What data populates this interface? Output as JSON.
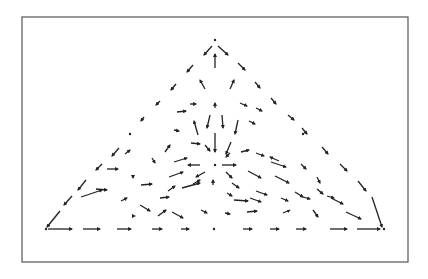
{
  "figure": {
    "frame": {
      "x": 22,
      "y": 17,
      "w": 386,
      "h": 245,
      "stroke": "#555555"
    },
    "vertices": [
      [
        215,
        41
      ],
      [
        44,
        229
      ],
      [
        384,
        229
      ],
      [
        215,
        165
      ]
    ],
    "segments": [
      [
        212,
        46,
        204,
        55
      ],
      [
        193,
        65,
        187,
        72
      ],
      [
        176,
        84,
        171,
        90
      ],
      [
        160,
        101,
        156,
        105
      ],
      [
        144,
        117,
        141,
        121
      ],
      [
        119,
        148,
        112,
        156
      ],
      [
        102,
        164,
        96,
        170
      ],
      [
        86,
        180,
        78,
        190
      ],
      [
        72,
        196,
        64,
        205
      ],
      [
        60,
        211,
        47,
        227
      ],
      [
        218,
        46,
        228,
        55
      ],
      [
        238,
        63,
        245,
        70
      ],
      [
        255,
        82,
        260,
        88
      ],
      [
        271,
        98,
        276,
        104
      ],
      [
        288,
        115,
        294,
        120
      ],
      [
        302,
        128,
        307,
        134
      ],
      [
        322,
        147,
        328,
        154
      ],
      [
        340,
        164,
        347,
        171
      ],
      [
        358,
        181,
        366,
        191
      ],
      [
        372,
        197,
        382,
        227
      ],
      [
        48,
        229,
        72,
        229
      ],
      [
        83,
        229,
        100,
        229
      ],
      [
        117,
        229,
        131,
        229
      ],
      [
        152,
        229,
        162,
        229
      ],
      [
        181,
        229,
        189,
        229
      ],
      [
        243,
        229,
        252,
        229
      ],
      [
        270,
        229,
        279,
        229
      ],
      [
        296,
        229,
        306,
        229
      ],
      [
        330,
        229,
        347,
        229
      ],
      [
        357,
        229,
        380,
        229
      ],
      [
        215,
        68,
        215,
        54
      ],
      [
        205,
        89,
        200,
        80
      ],
      [
        230,
        89,
        234,
        80
      ],
      [
        190,
        104,
        196,
        104
      ],
      [
        215,
        108,
        215,
        103
      ],
      [
        240,
        103,
        247,
        106
      ],
      [
        256,
        108,
        262,
        111
      ],
      [
        177,
        112,
        186,
        111
      ],
      [
        210,
        115,
        207,
        128
      ],
      [
        222,
        115,
        223,
        128
      ],
      [
        174,
        130,
        179,
        131
      ],
      [
        249,
        121,
        255,
        124
      ],
      [
        238,
        120,
        235,
        134
      ],
      [
        198,
        135,
        194,
        121
      ],
      [
        215,
        133,
        215,
        152
      ],
      [
        231,
        142,
        226,
        154
      ],
      [
        165,
        152,
        170,
        145
      ],
      [
        191,
        143,
        200,
        144
      ],
      [
        205,
        145,
        210,
        151
      ],
      [
        241,
        152,
        249,
        150
      ],
      [
        256,
        153,
        264,
        156
      ],
      [
        279,
        161,
        270,
        157
      ],
      [
        230,
        153,
        226,
        157
      ],
      [
        125,
        154,
        130,
        150
      ],
      [
        152,
        158,
        155,
        163
      ],
      [
        174,
        162,
        187,
        158
      ],
      [
        222,
        165,
        236,
        165
      ],
      [
        200,
        165,
        188,
        165
      ],
      [
        271,
        162,
        286,
        167
      ],
      [
        301,
        164,
        306,
        169
      ],
      [
        205,
        172,
        196,
        177
      ],
      [
        226,
        172,
        232,
        178
      ],
      [
        169,
        177,
        183,
        172
      ],
      [
        193,
        184,
        200,
        180
      ],
      [
        248,
        171,
        261,
        178
      ],
      [
        275,
        176,
        289,
        183
      ],
      [
        317,
        177,
        320,
        183
      ],
      [
        107,
        169,
        118,
        169
      ],
      [
        133,
        177,
        133,
        178
      ],
      [
        141,
        185,
        152,
        184
      ],
      [
        168,
        191,
        175,
        186
      ],
      [
        182,
        188,
        200,
        183
      ],
      [
        213,
        185,
        213,
        180
      ],
      [
        232,
        183,
        239,
        188
      ],
      [
        256,
        191,
        267,
        195
      ],
      [
        295,
        192,
        303,
        197
      ],
      [
        317,
        189,
        323,
        194
      ],
      [
        331,
        198,
        343,
        204
      ],
      [
        96,
        189,
        107,
        190
      ],
      [
        160,
        198,
        169,
        197
      ],
      [
        227,
        193,
        232,
        196
      ],
      [
        234,
        200,
        248,
        201
      ],
      [
        250,
        198,
        261,
        202
      ],
      [
        281,
        198,
        288,
        201
      ],
      [
        303,
        197,
        310,
        199
      ],
      [
        327,
        196,
        334,
        198
      ],
      [
        81,
        197,
        102,
        190
      ],
      [
        121,
        201,
        127,
        198
      ],
      [
        140,
        205,
        150,
        211
      ],
      [
        172,
        212,
        183,
        218
      ],
      [
        201,
        210,
        207,
        213
      ],
      [
        225,
        213,
        230,
        214
      ],
      [
        247,
        212,
        257,
        211
      ],
      [
        283,
        213,
        290,
        210
      ],
      [
        313,
        210,
        318,
        217
      ],
      [
        346,
        212,
        361,
        219
      ],
      [
        158,
        216,
        166,
        210
      ],
      [
        135,
        216,
        135,
        216
      ]
    ],
    "dots": [
      [
        130,
        134
      ],
      [
        46,
        229
      ],
      [
        214,
        229
      ],
      [
        384,
        229
      ],
      [
        215,
        40
      ],
      [
        215,
        165
      ],
      [
        303,
        134
      ]
    ],
    "stroke_color": "#222222"
  }
}
